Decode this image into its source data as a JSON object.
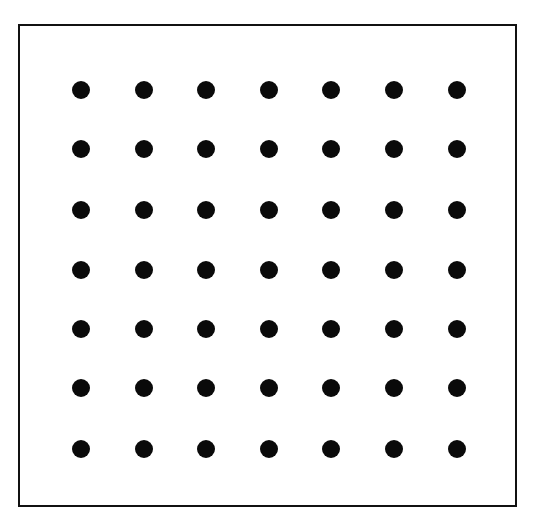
{
  "diagram": {
    "type": "dot-grid",
    "rows": 7,
    "cols": 7,
    "dot_color": "#0a0a0a",
    "frame_color": "#111111",
    "background": "#ffffff",
    "dot_radius": 9,
    "col_x": [
      81,
      144,
      206,
      269,
      331,
      394,
      457
    ],
    "row_y": [
      90,
      149,
      210,
      270,
      329,
      388,
      449
    ]
  }
}
